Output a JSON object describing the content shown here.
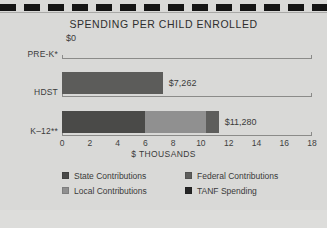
{
  "chart_data": {
    "type": "bar",
    "orientation": "horizontal",
    "stacked": true,
    "title": "SPENDING PER CHILD ENROLLED",
    "xlabel": "$ THOUSANDS",
    "ylabel": "",
    "xlim": [
      0,
      18
    ],
    "xticks": [
      "0",
      "2",
      "4",
      "6",
      "8",
      "10",
      "12",
      "14",
      "16",
      "18"
    ],
    "xtick_values": [
      0,
      2,
      4,
      6,
      8,
      10,
      12,
      14,
      16,
      18
    ],
    "grid": false,
    "legend_position": "bottom",
    "categories": [
      "PRE-K*",
      "HDST",
      "K–12**"
    ],
    "totals": [
      0,
      7262,
      11280
    ],
    "total_labels": [
      "$0",
      "$7,262",
      "$11,280"
    ],
    "series": [
      {
        "name": "State Contributions",
        "color": "#4a4a4a",
        "values": [
          0,
          0,
          6000
        ]
      },
      {
        "name": "Local Contributions",
        "color": "#8f8f8d",
        "values": [
          0,
          0,
          4300
        ]
      },
      {
        "name": "Federal Contributions",
        "color": "#6a6a68",
        "values": [
          0,
          7262,
          900
        ]
      },
      {
        "name": "TANF Spending",
        "color": "#2b2b2b",
        "values": [
          0,
          0,
          80
        ]
      }
    ],
    "rows": [
      {
        "category": "PRE-K*",
        "label": "$0",
        "segments": []
      },
      {
        "category": "HDST",
        "label": "$7,262",
        "segments": [
          {
            "series": "Federal Contributions",
            "value": 7262,
            "color": "#5c5c5a"
          }
        ]
      },
      {
        "category": "K–12**",
        "label": "$11,280",
        "segments": [
          {
            "series": "State Contributions",
            "value": 6000,
            "color": "#4a4a48"
          },
          {
            "series": "Local Contributions",
            "value": 4400,
            "color": "#909090"
          },
          {
            "series": "Federal Contributions",
            "value": 880,
            "color": "#5e5e5c"
          }
        ]
      }
    ]
  },
  "legend": {
    "items": [
      {
        "label": "State Contributions",
        "color": "#4a4a48"
      },
      {
        "label": "Federal Contributions",
        "color": "#5e5e5c"
      },
      {
        "label": "Local Contributions",
        "color": "#909090"
      },
      {
        "label": "TANF Spending",
        "color": "#262626"
      }
    ]
  },
  "decor": {
    "rule_color": "#141414"
  }
}
